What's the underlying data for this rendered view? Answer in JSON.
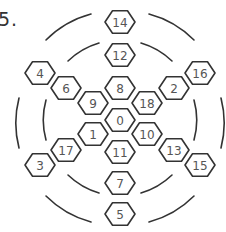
{
  "problem_number": "5.",
  "colors": {
    "stroke": "#333333",
    "text": "#555555",
    "background": "#ffffff"
  },
  "diagram": {
    "center": [
      120,
      118
    ],
    "hexagons": [
      {
        "label": "14",
        "x": 120,
        "y": 22
      },
      {
        "label": "12",
        "x": 120,
        "y": 55
      },
      {
        "label": "8",
        "x": 120,
        "y": 88
      },
      {
        "label": "0",
        "x": 120,
        "y": 120
      },
      {
        "label": "11",
        "x": 120,
        "y": 152
      },
      {
        "label": "7",
        "x": 120,
        "y": 183
      },
      {
        "label": "5",
        "x": 120,
        "y": 214
      },
      {
        "label": "4",
        "x": 40,
        "y": 73
      },
      {
        "label": "6",
        "x": 66,
        "y": 88
      },
      {
        "label": "9",
        "x": 93,
        "y": 103
      },
      {
        "label": "1",
        "x": 93,
        "y": 134
      },
      {
        "label": "17",
        "x": 66,
        "y": 150
      },
      {
        "label": "3",
        "x": 40,
        "y": 165
      },
      {
        "label": "16",
        "x": 200,
        "y": 73
      },
      {
        "label": "2",
        "x": 174,
        "y": 88
      },
      {
        "label": "18",
        "x": 147,
        "y": 103
      },
      {
        "label": "10",
        "x": 147,
        "y": 134
      },
      {
        "label": "13",
        "x": 174,
        "y": 150
      },
      {
        "label": "15",
        "x": 200,
        "y": 165
      }
    ]
  }
}
